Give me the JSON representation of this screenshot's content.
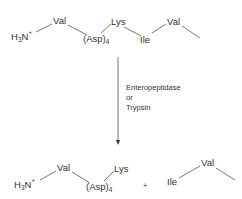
{
  "substrate": {
    "n_terminus": {
      "base": "H",
      "sub": "3",
      "atom": "N",
      "charge": "+"
    },
    "residues": [
      "Val",
      "(Asp)",
      "Lys",
      "Ile",
      "Val"
    ],
    "asp_repeat": "4"
  },
  "reaction": {
    "enzyme_lines": [
      "Enteropeptidase",
      "or",
      "Trypsin"
    ]
  },
  "products": {
    "fragment1": {
      "n_terminus": {
        "base": "H",
        "sub": "3",
        "atom": "N",
        "charge": "+"
      },
      "residues": [
        "Val",
        "(Asp)",
        "Lys"
      ],
      "asp_repeat": "4"
    },
    "plus": "+",
    "fragment2": {
      "residues": [
        "Ile",
        "Val"
      ]
    }
  },
  "colors": {
    "text": "#333333",
    "bond": "#555555"
  }
}
